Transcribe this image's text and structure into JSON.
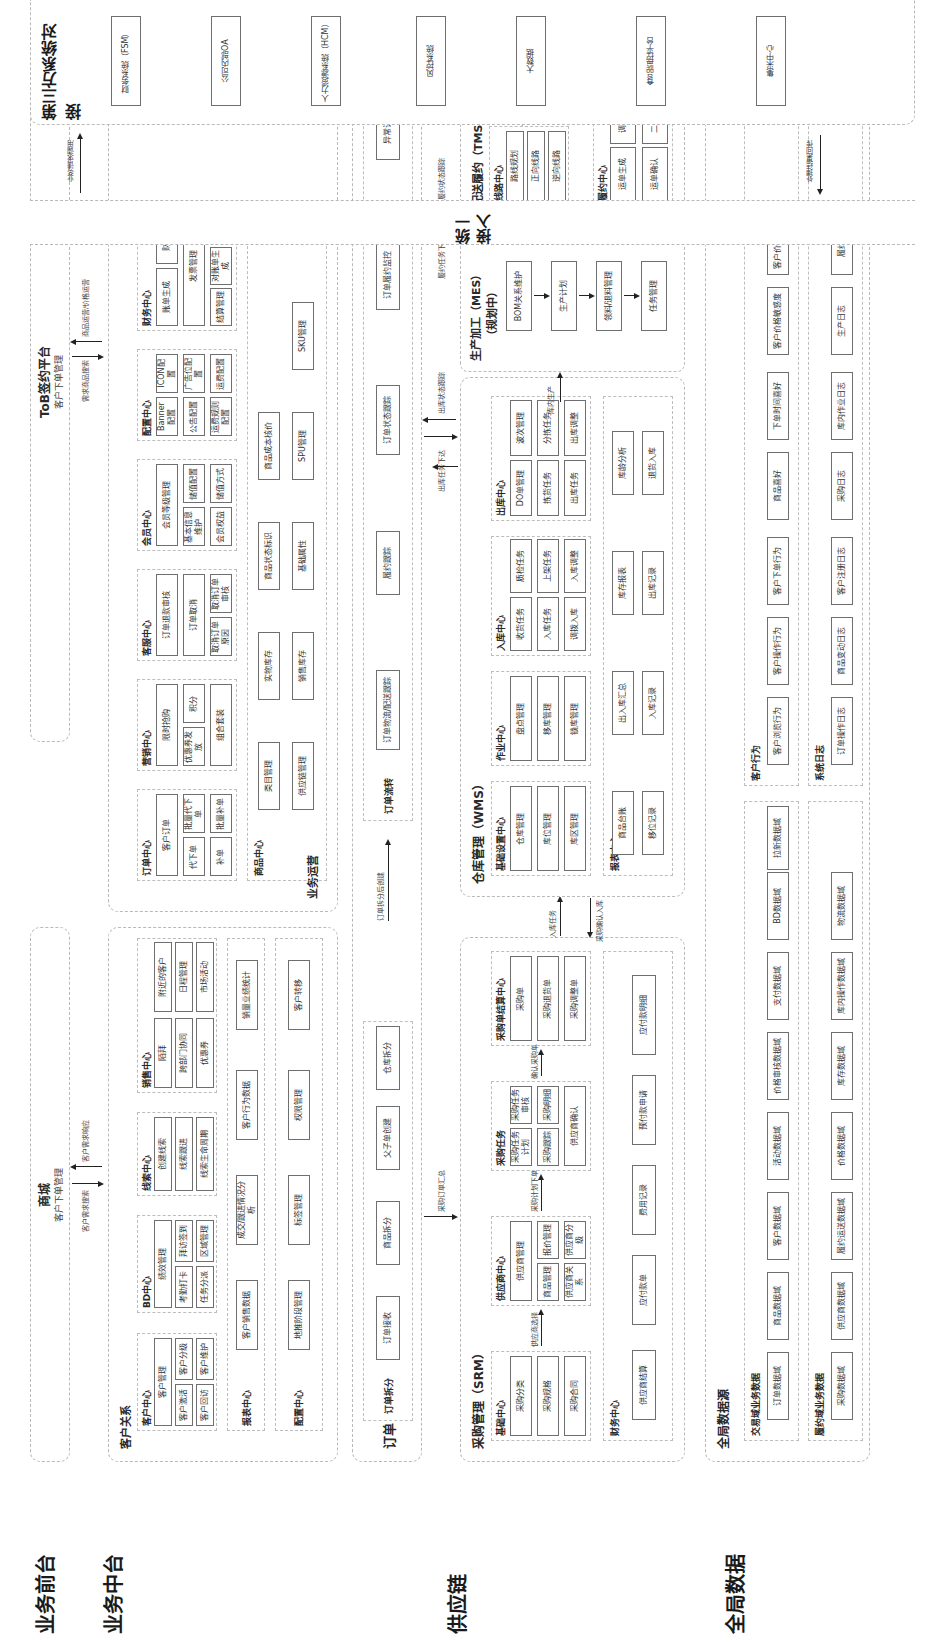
{
  "layers": {
    "front": "业务前台",
    "middle": "业务中台",
    "supply": "供应链",
    "global": "全局数据",
    "third": "第三方系统对接",
    "unified": "统一接入"
  },
  "front": {
    "mall": {
      "title": "商城",
      "sub": "客户下单管理"
    },
    "tob": {
      "title": "ToB签约平台",
      "sub": "客户下单管理"
    },
    "flows": {
      "mall_out": "客户需求搜索",
      "mall_in": "客户需求响应",
      "tob_out": "需求商品搜索",
      "tob_in": "商品运营/价格运营"
    }
  },
  "middle": {
    "customer_relation": {
      "title": "客户关系",
      "customer_center": {
        "title": "客户中心",
        "items": [
          "客户管理",
          "客户激活",
          "客户分级",
          "客户回访",
          "客户维护"
        ]
      },
      "bd_center": {
        "title": "BD中心",
        "items": [
          "绩效管理",
          "考勤打卡",
          "拜访签到",
          "任务分派",
          "区域管理",
          "BD审核"
        ]
      },
      "lead_center": {
        "title": "线索中心",
        "items": [
          "创建线索",
          "线索跟进",
          "线索生命周期"
        ]
      },
      "sales_center": {
        "title": "销售中心",
        "items": [
          "陌拜",
          "附近的客户",
          "跨部门协同",
          "日程管理",
          "优惠券",
          "市场活动"
        ]
      },
      "report_center": {
        "title": "报表中心",
        "items": [
          "客户销售数据",
          "成交/跟进情况分析",
          "客户行为数据",
          "销量业绩统计"
        ]
      },
      "config_center": {
        "title": "配置中心",
        "items": [
          "地推阶段管理",
          "标签管理",
          "权限管理",
          "客户转移"
        ]
      }
    },
    "ops": {
      "title": "业务运营",
      "order_center": {
        "title": "订单中心",
        "items": [
          "客户订单",
          "代下单",
          "批量代下单",
          "补单",
          "批量补单"
        ]
      },
      "marketing_center": {
        "title": "营销中心",
        "items": [
          "限时抢购",
          "优惠券发放",
          "积分",
          "组合套装"
        ]
      },
      "service_center": {
        "title": "客服中心",
        "items": [
          "订单退款审核",
          "订单取消",
          "取消订单原因",
          "取消订单审核"
        ]
      },
      "member_center": {
        "title": "会员中心",
        "items": [
          "会员等级管理",
          "基本信息维护",
          "储值配置",
          "会员权益",
          "储值方式"
        ]
      },
      "config_center": {
        "title": "配置中心",
        "items": [
          "Banner配置",
          "ICON配置",
          "公告配置",
          "广告位配置",
          "运费规则配置",
          "运费配置"
        ]
      },
      "finance_center": {
        "title": "财务中心",
        "items": [
          "账单生成",
          "财务审核",
          "发票管理",
          "结算管理",
          "对账单生成",
          "在线开票"
        ]
      },
      "goods_center": {
        "title": "商品中心",
        "items": [
          "类目管理",
          "供应链管理",
          "实物库存",
          "销售库存",
          "商品状态标识",
          "基础属性",
          "商品成本核价",
          "SPU管理",
          "SKU管理"
        ]
      }
    },
    "flows": {
      "up": "客户拉新",
      "down": "客户留存"
    }
  },
  "order": {
    "title": "订单",
    "split": {
      "title": "订单拆分",
      "items": [
        "订单接收",
        "商品拆分",
        "父子单创建",
        "仓库拆分"
      ]
    },
    "flow": {
      "title": "订单流转",
      "items": [
        "订单物流/配送跟踪",
        "履约跟踪",
        "订单状态跟踪",
        "订单履约监控",
        "异常订单处理"
      ]
    },
    "flows": {
      "to_flow": "订单拆分后创建",
      "supply_summary": "采购订单汇总",
      "out_down": "出库任务下达",
      "out_up": "出库状态跟踪",
      "fulfil_down": "履约任务下达",
      "fulfil_up": "履约状态跟踪"
    }
  },
  "supply": {
    "srm": {
      "title": "采购管理（SRM）",
      "base_center": {
        "title": "基础中心",
        "items": [
          "采购分类",
          "采购规格",
          "采购合同"
        ]
      },
      "supplier_center": {
        "title": "供应商中心",
        "items": [
          "供应商管理",
          "商品管理",
          "报价管理",
          "供应商关系",
          "供应商分级"
        ]
      },
      "task": {
        "title": "采购任务",
        "items": [
          "采购任务计划",
          "采购任务审核",
          "采购跟踪",
          "采购明细",
          "供应商确认"
        ]
      },
      "payment_center": {
        "title": "采购单结算中心",
        "items": [
          "采购单",
          "采购退货单",
          "采购调整单"
        ]
      },
      "finance_center": {
        "title": "财务中心",
        "items": [
          "供应商结算",
          "应付款单",
          "费用记录",
          "预付款申请",
          "应付款明细"
        ]
      },
      "flows": {
        "a": "供应商选择",
        "b": "采购计划下单",
        "c": "确认采购单"
      }
    },
    "wms": {
      "title": "仓库管理（WMS）",
      "base_center": {
        "title": "基础设置中心",
        "items": [
          "仓库管理",
          "库位管理",
          "库区管理"
        ]
      },
      "work_center": {
        "title": "作业中心",
        "items": [
          "盘点管理",
          "移库管理",
          "锁库管理"
        ]
      },
      "inbound_center": {
        "title": "入库中心",
        "items": [
          "收货任务",
          "入库任务",
          "调拨入库",
          "质检任务",
          "上架任务",
          "入库调整"
        ]
      },
      "outbound_center": {
        "title": "出库中心",
        "items": [
          "DO单管理",
          "拣货任务",
          "出库任务",
          "波次管理",
          "分拣任务",
          "出库调整"
        ]
      },
      "report_center": {
        "title": "报表中心",
        "items": [
          "商品台账",
          "移位记录",
          "出入库汇总",
          "入库记录",
          "库存报表",
          "出库记录",
          "库龄分析",
          "退货入库"
        ]
      },
      "flows": {
        "in": "入库任务",
        "confirm": "采购确认入库"
      }
    },
    "mes": {
      "title": "生产加工（MES）",
      "sub": "（规划中）",
      "items": [
        "BOM关系维护",
        "生产计划",
        "领料/退料管理",
        "任务管理"
      ],
      "flow": "库内生产"
    },
    "tms": {
      "title": "配送履约（TMS）",
      "route_center": {
        "title": "线路中心",
        "items": [
          "路线规划",
          "正向线路",
          "逆向线路"
        ]
      },
      "driver_center": {
        "title": "司机中心",
        "items": [
          "车辆管理",
          "司机管理",
          "运力调度"
        ]
      },
      "fulfil_center": {
        "title": "履约中心",
        "items": [
          "运单生成",
          "运单确认",
          "调度管理",
          "二次分拣",
          "运单跟踪",
          "逆向管理"
        ]
      },
      "flows": {
        "task": "任务下发",
        "exec": "履约执行"
      }
    }
  },
  "global": {
    "title": "全局数据源",
    "trade": {
      "title": "交易域业务数据",
      "items": [
        "订单数据域",
        "商品数据域",
        "客户数据域",
        "活动数据域",
        "价格审核数据域",
        "支付数据域",
        "BD数据域",
        "拉新数据域"
      ]
    },
    "fulfil": {
      "title": "履约域业务数据",
      "items": [
        "采购数据域",
        "供应商数据域",
        "履约运送数据域",
        "价格数据域",
        "库存数据域",
        "库内操作数据域",
        "物流数据域"
      ]
    },
    "behavior": {
      "title": "客户行为",
      "items": [
        "客户浏览行为",
        "客户操作行为",
        "客户下单行为",
        "商品喜好",
        "下单时间喜好",
        "客户价格敏感度",
        "客户价格接受度"
      ]
    },
    "logs": {
      "title": "系统日志",
      "items": [
        "订单操作日志",
        "商品变动日志",
        "客户注册日志",
        "采购日志",
        "库内作业日志",
        "生产日志",
        "履约日志"
      ]
    }
  },
  "unified": {
    "flows": {
      "left": "业务请求调用",
      "right": "处理结果回传"
    }
  },
  "third": {
    "items": [
      "财务系统（FSM）",
      "公司内部OA",
      "人力资源系统（HCM）",
      "风控系统",
      "大数据",
      "食品监控平台",
      "集采中心"
    ]
  }
}
